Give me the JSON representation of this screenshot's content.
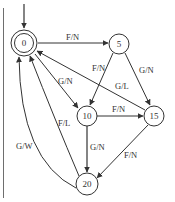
{
  "diagram": {
    "type": "state-machine",
    "start_state": "0",
    "accept_states": [
      "0"
    ],
    "nodes": [
      {
        "id": "0",
        "label": "0",
        "x": 24,
        "y": 43,
        "r": 10,
        "double": true
      },
      {
        "id": "5",
        "label": "5",
        "x": 119,
        "y": 44,
        "r": 10
      },
      {
        "id": "10",
        "label": "10",
        "x": 87,
        "y": 116,
        "r": 10
      },
      {
        "id": "15",
        "label": "15",
        "x": 154,
        "y": 116,
        "r": 10
      },
      {
        "id": "20",
        "label": "20",
        "x": 87,
        "y": 184,
        "r": 11
      }
    ],
    "edges": [
      {
        "from": "0",
        "to": "5",
        "label": "F/N"
      },
      {
        "from": "0",
        "to": "10",
        "label": "G/N"
      },
      {
        "from": "5",
        "to": "10",
        "label": "F/N"
      },
      {
        "from": "5",
        "to": "15",
        "label": "G/N"
      },
      {
        "from": "15",
        "to": "0",
        "label": "G/L"
      },
      {
        "from": "10",
        "to": "15",
        "label": "F/N"
      },
      {
        "from": "10",
        "to": "20",
        "label": "G/N"
      },
      {
        "from": "15",
        "to": "20",
        "label": "F/N"
      },
      {
        "from": "20",
        "to": "0",
        "label": "F/L"
      },
      {
        "from": "20",
        "to": "0",
        "label": "G/W"
      }
    ],
    "colors": {
      "stroke": "#333333",
      "rule": "#6e6e6e",
      "background": "#ffffff"
    }
  }
}
